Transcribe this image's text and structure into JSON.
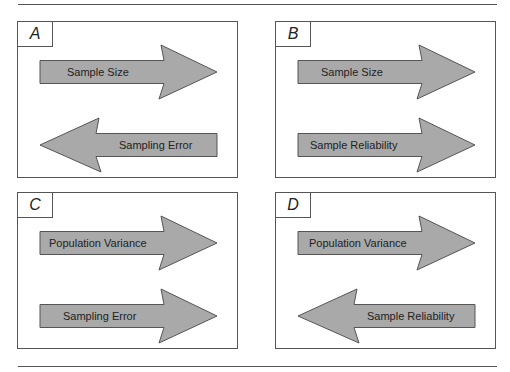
{
  "figure": {
    "colors": {
      "arrow_fill": "#a9a9a9",
      "arrow_stroke": "#555555",
      "border": "#555555",
      "text": "#222222"
    },
    "panels": [
      {
        "label": "A",
        "x": 17,
        "y": 21,
        "arrows": [
          {
            "direction": "right",
            "row": "top",
            "text": "Sample Size",
            "text_x": 49
          },
          {
            "direction": "left",
            "row": "bottom",
            "text": "Sampling Error",
            "text_x": 101
          }
        ]
      },
      {
        "label": "B",
        "x": 275,
        "y": 21,
        "arrows": [
          {
            "direction": "right",
            "row": "top",
            "text": "Sample Size",
            "text_x": 45
          },
          {
            "direction": "right",
            "row": "bottom",
            "text": "Sample Reliability",
            "text_x": 34
          }
        ]
      },
      {
        "label": "C",
        "x": 17,
        "y": 192,
        "arrows": [
          {
            "direction": "right",
            "row": "top",
            "text": "Population Variance",
            "text_x": 31
          },
          {
            "direction": "right",
            "row": "bottom",
            "text": "Sampling Error",
            "text_x": 45
          }
        ]
      },
      {
        "label": "D",
        "x": 275,
        "y": 192,
        "arrows": [
          {
            "direction": "right",
            "row": "top",
            "text": "Population Variance",
            "text_x": 33
          },
          {
            "direction": "left",
            "row": "bottom",
            "text": "Sample Reliability",
            "text_x": 91
          }
        ]
      }
    ]
  }
}
